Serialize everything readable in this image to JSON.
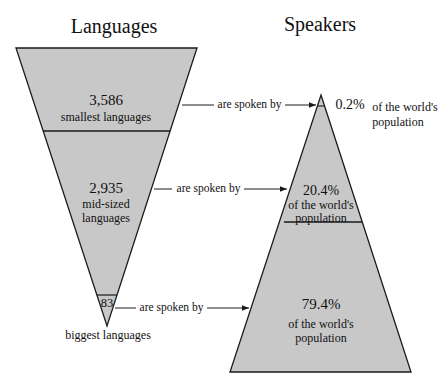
{
  "titles": {
    "left": "Languages",
    "right": "Speakers"
  },
  "colors": {
    "fill": "#c8c8c8",
    "stroke": "#1a1a1a",
    "background": "#ffffff"
  },
  "connector": "are spoken by",
  "languages": [
    {
      "count": "3,586",
      "label": "smallest languages"
    },
    {
      "count": "2,935",
      "label_line1": "mid-sized",
      "label_line2": "languages"
    },
    {
      "count": "83",
      "label": "biggest languages"
    }
  ],
  "speakers": [
    {
      "percent": "0.2%",
      "label_line1": "of the world's",
      "label_line2": "population"
    },
    {
      "percent": "20.4%",
      "label_line1": "of the world's",
      "label_line2": "population"
    },
    {
      "percent": "79.4%",
      "label_line1": "of the world's",
      "label_line2": "population"
    }
  ]
}
